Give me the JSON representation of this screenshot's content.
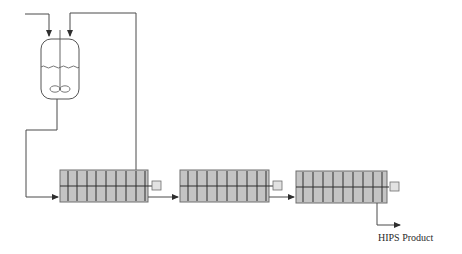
{
  "diagram": {
    "colors": {
      "line": "#4a4a4a",
      "reactor_fill": "#c4c4c4",
      "reactor_border": "#6e6e6e",
      "baffle": "#2e2e2e",
      "motor_fill": "#e2e2e2",
      "vessel_stroke": "#555555"
    },
    "nodes": [
      {
        "id": "feed-dissolver",
        "type": "stirred-vessel",
        "icon": "agitated-tank-icon"
      },
      {
        "id": "reactor-1",
        "type": "horizontal-tower-reactor",
        "icon": "baffled-reactor-icon",
        "compartments": 9
      },
      {
        "id": "reactor-2",
        "type": "horizontal-tower-reactor",
        "icon": "baffled-reactor-icon",
        "compartments": 9
      },
      {
        "id": "reactor-3",
        "type": "horizontal-tower-reactor",
        "icon": "baffled-reactor-icon",
        "compartments": 9
      }
    ],
    "product_label": "HIPS Product"
  }
}
